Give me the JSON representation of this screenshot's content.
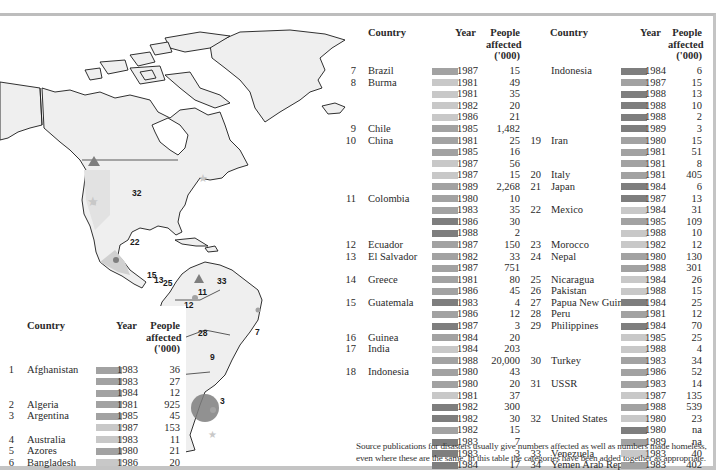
{
  "headers": {
    "country": "Country",
    "year": "Year",
    "people": "People",
    "affected": "affected",
    "unit": "('000)"
  },
  "shades": {
    "light": "#c8c8c8",
    "mid": "#a2a2a2",
    "dark": "#7e7e7e"
  },
  "map": {
    "labels": [
      "32",
      "22",
      "15",
      "13",
      "25",
      "33",
      "11",
      "12",
      "28",
      "7",
      "9",
      "3"
    ]
  },
  "left_table": [
    {
      "num": "1",
      "country": "Afghanistan",
      "year": "1983",
      "value": "36",
      "shade": "mid"
    },
    {
      "num": "",
      "country": "",
      "year": "1983",
      "value": "27",
      "shade": "mid"
    },
    {
      "num": "",
      "country": "",
      "year": "1984",
      "value": "12",
      "shade": "mid"
    },
    {
      "num": "2",
      "country": "Algeria",
      "year": "1981",
      "value": "925",
      "shade": "mid"
    },
    {
      "num": "3",
      "country": "Argentina",
      "year": "1985",
      "value": "45",
      "shade": "mid"
    },
    {
      "num": "",
      "country": "",
      "year": "1987",
      "value": "153",
      "shade": "light"
    },
    {
      "num": "4",
      "country": "Australia",
      "year": "1983",
      "value": "11",
      "shade": "light"
    },
    {
      "num": "5",
      "country": "Azores",
      "year": "1980",
      "value": "21",
      "shade": "mid"
    },
    {
      "num": "6",
      "country": "Bangladesh",
      "year": "1986",
      "value": "20",
      "shade": "light"
    }
  ],
  "middle_table": [
    {
      "num": "7",
      "country": "Brazil",
      "year": "1987",
      "value": "15",
      "shade": "mid"
    },
    {
      "num": "8",
      "country": "Burma",
      "year": "1981",
      "value": "49",
      "shade": "light"
    },
    {
      "num": "",
      "country": "",
      "year": "1981",
      "value": "35",
      "shade": "light"
    },
    {
      "num": "",
      "country": "",
      "year": "1982",
      "value": "20",
      "shade": "light"
    },
    {
      "num": "",
      "country": "",
      "year": "1986",
      "value": "21",
      "shade": "light"
    },
    {
      "num": "9",
      "country": "Chile",
      "year": "1985",
      "value": "1,482",
      "shade": "mid"
    },
    {
      "num": "10",
      "country": "China",
      "year": "1981",
      "value": "25",
      "shade": "mid"
    },
    {
      "num": "",
      "country": "",
      "year": "1985",
      "value": "16",
      "shade": "mid"
    },
    {
      "num": "",
      "country": "",
      "year": "1987",
      "value": "56",
      "shade": "light"
    },
    {
      "num": "",
      "country": "",
      "year": "1987",
      "value": "15",
      "shade": "light"
    },
    {
      "num": "",
      "country": "",
      "year": "1989",
      "value": "2,268",
      "shade": "mid"
    },
    {
      "num": "11",
      "country": "Colombia",
      "year": "1980",
      "value": "10",
      "shade": "mid"
    },
    {
      "num": "",
      "country": "",
      "year": "1983",
      "value": "35",
      "shade": "mid"
    },
    {
      "num": "",
      "country": "",
      "year": "1986",
      "value": "30",
      "shade": "dark"
    },
    {
      "num": "",
      "country": "",
      "year": "1988",
      "value": "2",
      "shade": "dark"
    },
    {
      "num": "12",
      "country": "Ecuador",
      "year": "1987",
      "value": "150",
      "shade": "mid"
    },
    {
      "num": "13",
      "country": "El Salvador",
      "year": "1982",
      "value": "33",
      "shade": "mid"
    },
    {
      "num": "",
      "country": "",
      "year": "1987",
      "value": "751",
      "shade": "mid"
    },
    {
      "num": "14",
      "country": "Greece",
      "year": "1981",
      "value": "80",
      "shade": "mid"
    },
    {
      "num": "",
      "country": "",
      "year": "1986",
      "value": "45",
      "shade": "mid"
    },
    {
      "num": "15",
      "country": "Guatemala",
      "year": "1983",
      "value": "4",
      "shade": "dark"
    },
    {
      "num": "",
      "country": "",
      "year": "1986",
      "value": "12",
      "shade": "mid"
    },
    {
      "num": "",
      "country": "",
      "year": "1987",
      "value": "3",
      "shade": "dark"
    },
    {
      "num": "16",
      "country": "Guinea",
      "year": "1984",
      "value": "20",
      "shade": "mid"
    },
    {
      "num": "17",
      "country": "India",
      "year": "1984",
      "value": "203",
      "shade": "light"
    },
    {
      "num": "",
      "country": "",
      "year": "1988",
      "value": "20,000",
      "shade": "mid"
    },
    {
      "num": "18",
      "country": "Indonesia",
      "year": "1980",
      "value": "43",
      "shade": "mid"
    },
    {
      "num": "",
      "country": "",
      "year": "1980",
      "value": "20",
      "shade": "mid"
    },
    {
      "num": "",
      "country": "",
      "year": "1981",
      "value": "37",
      "shade": "light"
    },
    {
      "num": "",
      "country": "",
      "year": "1982",
      "value": "300",
      "shade": "dark"
    },
    {
      "num": "",
      "country": "",
      "year": "1982",
      "value": "30",
      "shade": "dark"
    },
    {
      "num": "",
      "country": "",
      "year": "1982",
      "value": "15",
      "shade": "mid"
    },
    {
      "num": "",
      "country": "",
      "year": "1983",
      "value": "7",
      "shade": "dark"
    },
    {
      "num": "",
      "country": "",
      "year": "1983",
      "value": "3",
      "shade": "dark"
    },
    {
      "num": "",
      "country": "",
      "year": "1984",
      "value": "17",
      "shade": "dark"
    }
  ],
  "right_table": [
    {
      "num": "",
      "country": "Indonesia",
      "year": "1984",
      "value": "6",
      "shade": "dark"
    },
    {
      "num": "",
      "country": "",
      "year": "1987",
      "value": "15",
      "shade": "mid"
    },
    {
      "num": "",
      "country": "",
      "year": "1988",
      "value": "13",
      "shade": "dark"
    },
    {
      "num": "",
      "country": "",
      "year": "1988",
      "value": "10",
      "shade": "dark"
    },
    {
      "num": "",
      "country": "",
      "year": "1988",
      "value": "2",
      "shade": "dark"
    },
    {
      "num": "",
      "country": "",
      "year": "1989",
      "value": "3",
      "shade": "dark"
    },
    {
      "num": "19",
      "country": "Iran",
      "year": "1980",
      "value": "15",
      "shade": "mid"
    },
    {
      "num": "",
      "country": "",
      "year": "1981",
      "value": "51",
      "shade": "mid"
    },
    {
      "num": "",
      "country": "",
      "year": "1981",
      "value": "8",
      "shade": "mid"
    },
    {
      "num": "20",
      "country": "Italy",
      "year": "1981",
      "value": "405",
      "shade": "mid"
    },
    {
      "num": "21",
      "country": "Japan",
      "year": "1984",
      "value": "6",
      "shade": "dark"
    },
    {
      "num": "",
      "country": "",
      "year": "1987",
      "value": "13",
      "shade": "dark"
    },
    {
      "num": "22",
      "country": "Mexico",
      "year": "1984",
      "value": "31",
      "shade": "light"
    },
    {
      "num": "",
      "country": "",
      "year": "1985",
      "value": "109",
      "shade": "mid"
    },
    {
      "num": "",
      "country": "",
      "year": "1988",
      "value": "10",
      "shade": "light"
    },
    {
      "num": "23",
      "country": "Morocco",
      "year": "1982",
      "value": "12",
      "shade": "light"
    },
    {
      "num": "24",
      "country": "Nepal",
      "year": "1980",
      "value": "130",
      "shade": "mid"
    },
    {
      "num": "",
      "country": "",
      "year": "1988",
      "value": "301",
      "shade": "mid"
    },
    {
      "num": "25",
      "country": "Nicaragua",
      "year": "1984",
      "value": "26",
      "shade": "light"
    },
    {
      "num": "26",
      "country": "Pakistan",
      "year": "1988",
      "value": "15",
      "shade": "light"
    },
    {
      "num": "27",
      "country": "Papua New Guin.",
      "year": "1984",
      "value": "25",
      "shade": "dark"
    },
    {
      "num": "28",
      "country": "Peru",
      "year": "1981",
      "value": "12",
      "shade": "mid"
    },
    {
      "num": "29",
      "country": "Philippines",
      "year": "1984",
      "value": "70",
      "shade": "dark"
    },
    {
      "num": "",
      "country": "",
      "year": "1985",
      "value": "25",
      "shade": "light"
    },
    {
      "num": "",
      "country": "",
      "year": "1988",
      "value": "4",
      "shade": "light"
    },
    {
      "num": "30",
      "country": "Turkey",
      "year": "1983",
      "value": "34",
      "shade": "mid"
    },
    {
      "num": "",
      "country": "",
      "year": "1986",
      "value": "52",
      "shade": "mid"
    },
    {
      "num": "31",
      "country": "USSR",
      "year": "1983",
      "value": "14",
      "shade": "mid"
    },
    {
      "num": "",
      "country": "",
      "year": "1987",
      "value": "135",
      "shade": "light"
    },
    {
      "num": "",
      "country": "",
      "year": "1988",
      "value": "539",
      "shade": "mid"
    },
    {
      "num": "32",
      "country": "United States",
      "year": "1980",
      "value": "23",
      "shade": "light"
    },
    {
      "num": "",
      "country": "",
      "year": "1980",
      "value": "na",
      "shade": "dark"
    },
    {
      "num": "",
      "country": "",
      "year": "1989",
      "value": "na",
      "shade": "mid"
    },
    {
      "num": "33",
      "country": "Venezuela",
      "year": "1983",
      "value": "40",
      "shade": "light"
    },
    {
      "num": "34",
      "country": "Yemen Arab Rep.",
      "year": "1983",
      "value": "402",
      "shade": "mid"
    }
  ],
  "footnote": "Source publications for disasters usually give numbers affected as well as numbers made homeless, even where these are the same. In this table the categories have been added together as appropriate."
}
